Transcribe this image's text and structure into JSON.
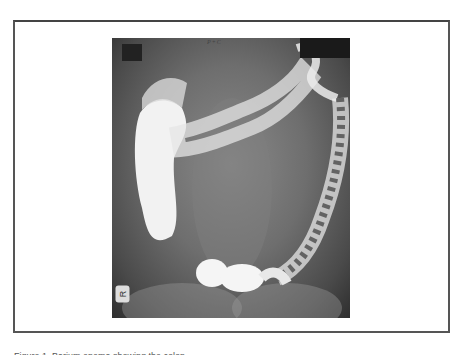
{
  "figure": {
    "image_alt": "Double-contrast barium enema radiograph of the colon",
    "film_annotation": "P+C",
    "side_marker": "R",
    "caption": "Figure 1. Barium enema showing the colon"
  }
}
